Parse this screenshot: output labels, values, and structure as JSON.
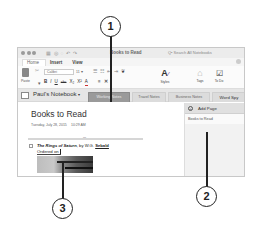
{
  "window": {
    "title": "Books to Read",
    "search_placeholder": "Q• Search All Notebooks"
  },
  "ribbon": {
    "tabs": [
      {
        "label": "Home",
        "active": true
      },
      {
        "label": "Insert",
        "active": false
      },
      {
        "label": "View",
        "active": false
      }
    ],
    "paste_label": "Paste",
    "font_name": "Calibri",
    "font_size": "11",
    "format_buttons": [
      "B",
      "I",
      "U",
      "abc",
      "X₂",
      "X²",
      "A"
    ],
    "styles_label": "Styles",
    "tags_label": "Tags",
    "todo_label": "To Do"
  },
  "notebook": {
    "name": "Paul's Notebook",
    "sections": [
      {
        "label": "Working Notes",
        "active": true
      },
      {
        "label": "Travel Notes",
        "active": false
      },
      {
        "label": "Business Notes",
        "active": false
      },
      {
        "label": "Word Spy",
        "active": false
      }
    ]
  },
  "page": {
    "title": "Books to Read",
    "date": "Tuesday, July 28, 2015",
    "time": "10:29 AM",
    "note_title": "The Rings of Saturn",
    "note_by": ", by W.G. ",
    "note_author": "Sebald",
    "ordered_on": "Ordered on"
  },
  "page_list": {
    "add_page_label": "Add Page",
    "pages": [
      "Books to Read"
    ]
  },
  "callouts": [
    "1",
    "2",
    "3"
  ]
}
